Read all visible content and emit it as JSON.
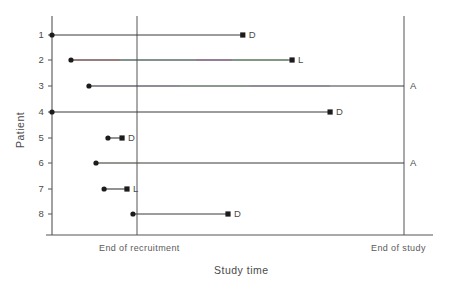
{
  "chart_data": {
    "type": "line",
    "title": "",
    "xlabel": "Study time",
    "ylabel": "Patient",
    "grid": false,
    "legend": "none",
    "x_axis": {
      "ticks": [],
      "annotations": [
        {
          "name": "end-of-recruitment",
          "label": "End of recruitment",
          "x": 0.34
        },
        {
          "name": "end-of-study",
          "label": "End of study",
          "x": 1.0
        }
      ],
      "xlim": [
        0,
        1.0
      ]
    },
    "y_axis": {
      "categories": [
        "1",
        "2",
        "3",
        "4",
        "5",
        "6",
        "7",
        "8"
      ],
      "ylim": [
        0.5,
        8.5
      ],
      "inverted": true
    },
    "outcome_codes": {
      "D": "Death",
      "L": "Lost to follow-up",
      "A": "Alive at end of study"
    },
    "series": [
      {
        "patient": "1",
        "start": 0.0,
        "end": 0.542,
        "outcome": "D"
      },
      {
        "patient": "2",
        "start": 0.054,
        "end": 0.682,
        "outcome": "L"
      },
      {
        "patient": "3",
        "start": 0.105,
        "end": 1.0,
        "outcome": "A"
      },
      {
        "patient": "4",
        "start": 0.0,
        "end": 0.79,
        "outcome": "D"
      },
      {
        "patient": "5",
        "start": 0.159,
        "end": 0.199,
        "outcome": "D"
      },
      {
        "patient": "6",
        "start": 0.125,
        "end": 1.0,
        "outcome": "A"
      },
      {
        "patient": "7",
        "start": 0.148,
        "end": 0.213,
        "outcome": "L"
      },
      {
        "patient": "8",
        "start": 0.23,
        "end": 0.5,
        "outcome": "D"
      }
    ]
  },
  "style": {
    "line_color": "#3a3a3a",
    "axis_color": "#555555",
    "marker_color": "#1c1c1c",
    "background": "#ffffff"
  }
}
